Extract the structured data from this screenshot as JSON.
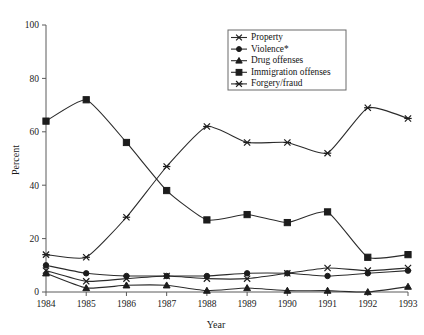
{
  "chart_data": {
    "type": "line",
    "title": "",
    "xlabel": "Year",
    "ylabel": "Percent",
    "categories": [
      1984,
      1985,
      1986,
      1987,
      1988,
      1989,
      1990,
      1991,
      1992,
      1993
    ],
    "xtick_labels": [
      "1984",
      "1985",
      "1986",
      "1987",
      "1988",
      "1989",
      "1990",
      "1991",
      "1992",
      "1993"
    ],
    "ytick_labels": [
      "0",
      "20",
      "40",
      "60",
      "80",
      "100"
    ],
    "yticks": [
      0,
      20,
      40,
      60,
      80,
      100
    ],
    "ylim": [
      0,
      100
    ],
    "xlim": [
      1984,
      1993
    ],
    "grid": false,
    "legend_position": "top-right",
    "series": [
      {
        "name": "Property",
        "marker": "x-cross",
        "values": [
          8,
          4,
          5,
          6,
          5,
          5,
          7,
          9,
          8,
          9
        ]
      },
      {
        "name": "Violence*",
        "marker": "filled-circle",
        "values": [
          10,
          7,
          6,
          6,
          6,
          7,
          7,
          6,
          7,
          8
        ]
      },
      {
        "name": "Drug offenses",
        "marker": "filled-triangle",
        "values": [
          7,
          1.5,
          2.5,
          2.5,
          0.5,
          1.5,
          0.5,
          0.5,
          0,
          2
        ]
      },
      {
        "name": "Immigration offenses",
        "marker": "filled-square",
        "values": [
          64,
          72,
          56,
          38,
          27,
          29,
          26,
          30,
          13,
          14
        ]
      },
      {
        "name": "Forgery/fraud",
        "marker": "asterisk",
        "values": [
          14,
          13,
          28,
          47,
          62,
          56,
          56,
          52,
          69,
          65
        ]
      }
    ],
    "legend": [
      {
        "label": "Property",
        "marker": "x-cross"
      },
      {
        "label": "Violence*",
        "marker": "filled-circle"
      },
      {
        "label": "Drug offenses",
        "marker": "filled-triangle"
      },
      {
        "label": "Immigration offenses",
        "marker": "filled-square"
      },
      {
        "label": "Forgery/fraud",
        "marker": "asterisk"
      }
    ],
    "colors": {
      "line": "#2b2b2b",
      "axis": "#5a5a5a",
      "text": "#1a1a1a",
      "background": "#ffffff"
    }
  }
}
